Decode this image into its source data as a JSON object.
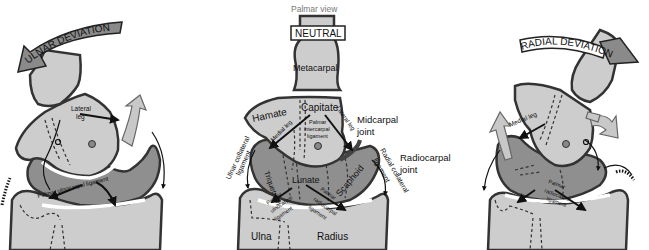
{
  "figure": {
    "view_label": "Palmar view",
    "panels": [
      {
        "id": "ulnar",
        "title": "ULNAR DEVIATION",
        "labels": {
          "lateral_leg": [
            "Lateral",
            "leg"
          ],
          "ligament": "Palmar ulnocarpal ligament"
        }
      },
      {
        "id": "neutral",
        "title": "NEUTRAL",
        "labels": {
          "metacarpal": "Metacarpal",
          "hamate": "Hamate",
          "capitate": "Capitate",
          "medial_leg": "Medial leg",
          "lateral_leg": "Lateral leg",
          "palmar_intercarpal": [
            "Palmar",
            "intercarpal",
            "ligament"
          ],
          "midcarpal_joint": [
            "Midcarpal",
            "joint"
          ],
          "radiocarpal_joint": [
            "Radiocarpal",
            "joint"
          ],
          "ulnar_collateral": [
            "Ulnar collateral",
            "ligament"
          ],
          "radial_collateral": [
            "Radial collateral",
            "ligament"
          ],
          "triquetrum": "Triquetrum",
          "lunate": "Lunate",
          "scaphoid": "Scaphoid",
          "palmar_ulnocarpal": [
            "Palmar",
            "ulnocarpal",
            "ligament"
          ],
          "palmar_radiocarpal": [
            "Palmar",
            "radiocarpal",
            "ligament"
          ],
          "ulna": "Ulna",
          "radius": "Radius"
        }
      },
      {
        "id": "radial",
        "title": "RADIAL DEVIATION",
        "labels": {
          "medial_leg": "Medial leg",
          "ligament": [
            "Palmar",
            "radiocarpal",
            "ligament"
          ]
        }
      }
    ]
  }
}
